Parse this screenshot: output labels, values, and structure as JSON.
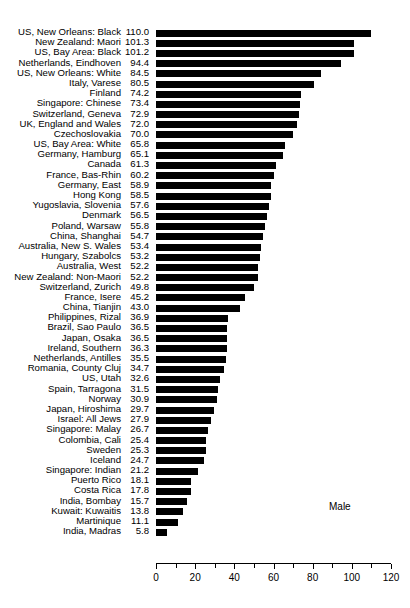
{
  "chart_data": {
    "type": "bar",
    "orientation": "horizontal",
    "title": "",
    "xlabel": "",
    "ylabel": "",
    "xlim": [
      0,
      120
    ],
    "xticks": [
      0,
      20,
      40,
      60,
      80,
      100,
      120
    ],
    "xtick_labels": [
      "0",
      "20",
      "40",
      "60",
      "80",
      "100",
      "120"
    ],
    "minor_tick_step": 10,
    "grid": false,
    "legend_position": "inside-right",
    "annotations": [
      {
        "text": "Male",
        "x": 88,
        "y": 6
      }
    ],
    "series": [
      {
        "name": "Male",
        "color": "#000000"
      }
    ],
    "categories": [
      "US, New Orleans: Black",
      "New Zealand: Maori",
      "US, Bay Area: Black",
      "Netherlands, Eindhoven",
      "US, New Orleans: White",
      "Italy, Varese",
      "Finland",
      "Singapore: Chinese",
      "Switzerland, Geneva",
      "UK, England and Wales",
      "Czechoslovakia",
      "US, Bay Area: White",
      "Germany, Hamburg",
      "Canada",
      "France, Bas-Rhin",
      "Germany, East",
      "Hong Kong",
      "Yugoslavia, Slovenia",
      "Denmark",
      "Poland, Warsaw",
      "China, Shanghai",
      "Australia, New S. Wales",
      "Hungary, Szabolcs",
      "Australia, West",
      "New Zealand: Non-Maori",
      "Switzerland, Zurich",
      "France, Isere",
      "China, Tianjin",
      "Philippines, Rizal",
      "Brazil, Sao Paulo",
      "Japan, Osaka",
      "Ireland, Southern",
      "Netherlands, Antilles",
      "Romania, County Cluj",
      "US, Utah",
      "Spain, Tarragona",
      "Norway",
      "Japan, Hiroshima",
      "Israel: All Jews",
      "Singapore: Malay",
      "Colombia, Cali",
      "Sweden",
      "Iceland",
      "Singapore: Indian",
      "Puerto Rico",
      "Costa Rica",
      "India, Bombay",
      "Kuwait: Kuwaitis",
      "Martinique",
      "India, Madras"
    ],
    "values": [
      110.0,
      101.3,
      101.2,
      94.4,
      84.5,
      80.5,
      74.2,
      73.4,
      72.9,
      72.0,
      70.0,
      65.8,
      65.1,
      61.3,
      60.2,
      58.9,
      58.5,
      57.6,
      56.5,
      55.8,
      54.7,
      53.4,
      53.2,
      52.2,
      52.2,
      49.8,
      45.2,
      43.0,
      36.9,
      36.5,
      36.5,
      36.3,
      35.5,
      34.7,
      32.6,
      31.5,
      30.9,
      29.7,
      27.9,
      26.7,
      25.4,
      25.3,
      24.7,
      21.2,
      18.1,
      17.8,
      15.7,
      13.8,
      11.1,
      5.8
    ],
    "value_labels": [
      "110.0",
      "101.3",
      "101.2",
      "94.4",
      "84.5",
      "80.5",
      "74.2",
      "73.4",
      "72.9",
      "72.0",
      "70.0",
      "65.8",
      "65.1",
      "61.3",
      "60.2",
      "58.9",
      "58.5",
      "57.6",
      "56.5",
      "55.8",
      "54.7",
      "53.4",
      "53.2",
      "52.2",
      "52.2",
      "49.8",
      "45.2",
      "43.0",
      "36.9",
      "36.5",
      "36.5",
      "36.3",
      "35.5",
      "34.7",
      "32.6",
      "31.5",
      "30.9",
      "29.7",
      "27.9",
      "26.7",
      "25.4",
      "25.3",
      "24.7",
      "21.2",
      "18.1",
      "17.8",
      "15.7",
      "13.8",
      "11.1",
      "5.8"
    ]
  }
}
